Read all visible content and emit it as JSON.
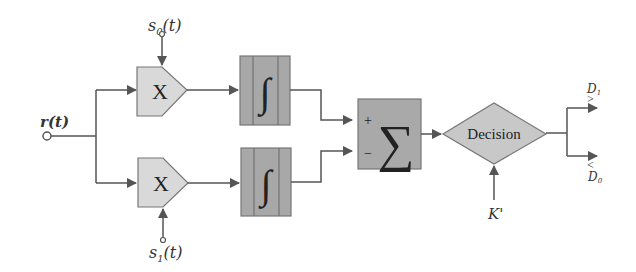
{
  "diagram": {
    "input": {
      "label": "r(t)"
    },
    "references": [
      {
        "id": "s0",
        "label_main": "s",
        "label_sub": "0",
        "label_arg": "(t)"
      },
      {
        "id": "s1",
        "label_main": "s",
        "label_sub": "1",
        "label_arg": "(t)"
      }
    ],
    "multipliers": [
      {
        "id": "mult-top",
        "symbol": "X"
      },
      {
        "id": "mult-bottom",
        "symbol": "X"
      }
    ],
    "integrators": [
      {
        "id": "int-top",
        "symbol": "∫"
      },
      {
        "id": "int-bottom",
        "symbol": "∫"
      }
    ],
    "summer": {
      "symbol": "∑",
      "plus": "+",
      "minus": "−"
    },
    "decision": {
      "label": "Decision",
      "threshold_label": "K'"
    },
    "outputs": [
      {
        "id": "D1",
        "compare": ">",
        "label_main": "D",
        "label_sub": "1"
      },
      {
        "id": "D0",
        "compare": "<",
        "label_main": "D",
        "label_sub": "0"
      }
    ]
  },
  "colors": {
    "line": "#555555",
    "multiplier_fill": "#d9d9d9",
    "integrator_fill": "#a8a8a8",
    "summer_fill": "#a9a9a9",
    "decision_fill": "#c8c8c8"
  }
}
